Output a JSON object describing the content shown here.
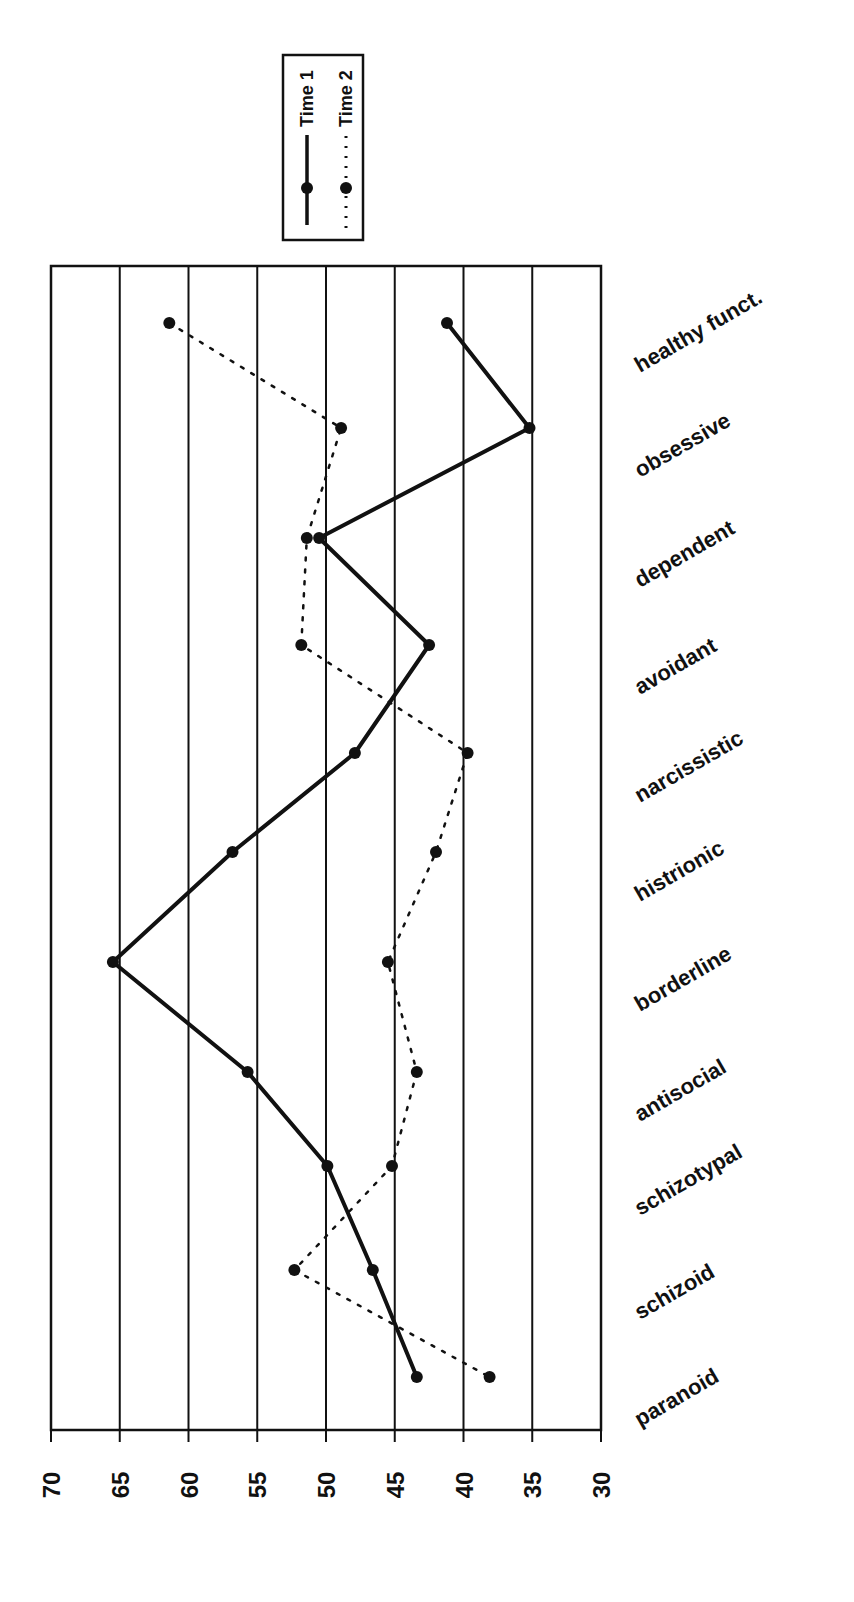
{
  "chart_data": {
    "type": "line",
    "orientation": "rotated-90",
    "title": "",
    "xlabel": "",
    "ylabel": "",
    "ylim": [
      30,
      70
    ],
    "value_ticks": [
      70,
      65,
      60,
      55,
      50,
      45,
      40,
      35,
      30
    ],
    "grid": true,
    "legend_position": "top",
    "categories": [
      "healthy funct.",
      "obsessive",
      "dependent",
      "avoidant",
      "narcissistic",
      "histrionic",
      "borderline",
      "antisocial",
      "schizotypal",
      "schizoid",
      "paranoid"
    ],
    "series": [
      {
        "name": "Time 1",
        "style": "solid",
        "values": [
          41.2,
          35.2,
          50.5,
          42.5,
          47.9,
          56.8,
          65.5,
          55.7,
          49.9,
          46.6,
          43.4
        ]
      },
      {
        "name": "Time 2",
        "style": "dotted",
        "values": [
          61.4,
          48.9,
          51.4,
          51.8,
          39.7,
          42.0,
          45.5,
          43.4,
          45.2,
          52.3,
          38.1
        ]
      }
    ]
  },
  "legend": {
    "items": [
      {
        "label": "Time 1",
        "style": "solid"
      },
      {
        "label": "Time 2",
        "style": "dotted"
      }
    ]
  },
  "colors": {
    "line": "#111111",
    "grid": "#111111",
    "background": "#ffffff"
  }
}
